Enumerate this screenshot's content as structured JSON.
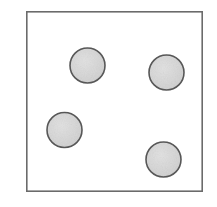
{
  "figure": {
    "name": "four-dot-square-diagram",
    "canvas": {
      "width": 217,
      "height": 207,
      "background_color": "#ffffff"
    },
    "frame": {
      "name": "square-outline",
      "x": 26,
      "y": 11,
      "width": 177,
      "height": 181,
      "stroke_color": "#6b6b6b",
      "stroke_width": 1.6,
      "fill_color": "#ffffff"
    },
    "dot_style": {
      "fill_color": "#d6d6d6",
      "stroke_color": "#595959",
      "stroke_width": 1.6,
      "highlight_color": "#e4e4e4",
      "shadow_color": "#c9c9c9"
    },
    "dots": [
      {
        "label": "dot-top-left",
        "cx": 87.5,
        "cy": 65.5,
        "r": 17.5
      },
      {
        "label": "dot-top-right",
        "cx": 166.5,
        "cy": 72.5,
        "r": 17.5
      },
      {
        "label": "dot-bottom-left",
        "cx": 64.5,
        "cy": 130.0,
        "r": 17.5
      },
      {
        "label": "dot-bottom-right",
        "cx": 163.5,
        "cy": 159.5,
        "r": 17.5
      }
    ],
    "dot_count": "4"
  }
}
